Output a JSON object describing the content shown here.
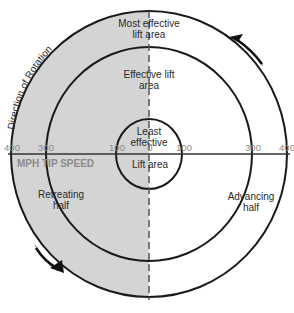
{
  "diagram": {
    "colors": {
      "retreating_fill": "#d4d4d4",
      "advancing_fill": "#ffffff",
      "line": "#1a1a1a",
      "tick_text": "#8a8a8a"
    },
    "rotation_label": "Direction of Rotation",
    "regions": {
      "most_effective_line1": "Most effective",
      "most_effective_line2": "lift area",
      "effective_line1": "Effective lift",
      "effective_line2": "area",
      "least_effective_line1": "Least",
      "least_effective_line2": "effective",
      "lift_area": "Lift area",
      "retreating_line1": "Retreating",
      "retreating_line2": "half",
      "advancing_line1": "Advancing",
      "advancing_line2": "half"
    },
    "axis": {
      "label": "MPH TIP SPEED",
      "ticks_left": [
        "400",
        "300",
        "100"
      ],
      "tick_center": "0",
      "ticks_right": [
        "100",
        "300",
        "400"
      ]
    }
  }
}
